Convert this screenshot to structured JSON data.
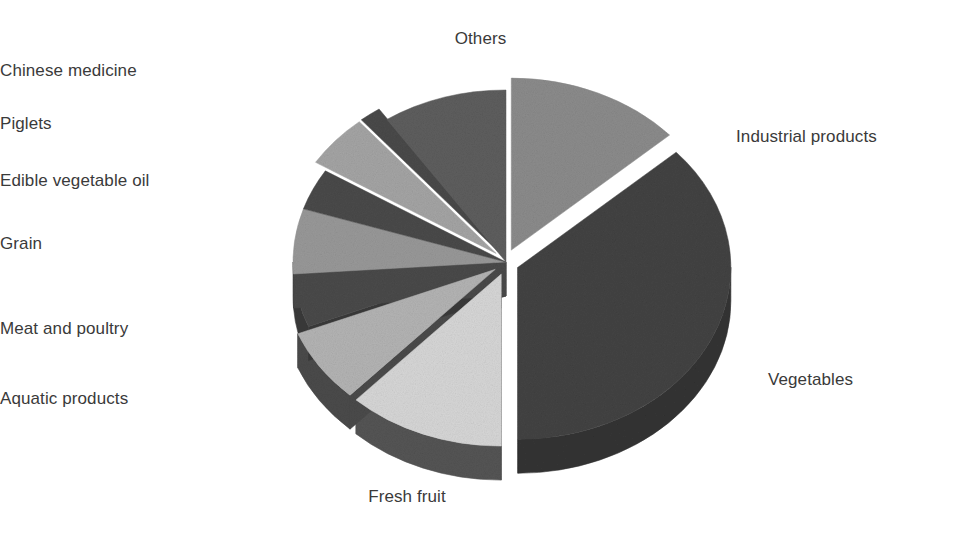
{
  "figure": {
    "background": "#ffffff",
    "text_color": "#3a3a3a"
  },
  "chart_data": {
    "type": "pie",
    "title": "",
    "subtitle": "",
    "xlabel": "",
    "ylabel": "",
    "style": "3d-exploded-pie",
    "grid": false,
    "legend": "none",
    "labels_position": "outside-leaderless",
    "start_angle_deg": 0,
    "direction": "clockwise",
    "categories": [
      "Industrial products",
      "Vegetables",
      "Fresh fruit",
      "Aquatic products",
      "Meat and poultry",
      "Grain",
      "Edible vegetable oil",
      "Piglets",
      "Chinese medicine",
      "Others"
    ],
    "values": [
      13.3,
      36.7,
      11.9,
      6.9,
      5.0,
      6.1,
      3.9,
      5.0,
      1.7,
      9.5
    ],
    "slices": [
      {
        "label": "Industrial products",
        "value": 13.3,
        "start_deg": 0,
        "end_deg": 48,
        "color": "#8c8c8c",
        "side_color": "#6d6d6d",
        "exploded": true
      },
      {
        "label": "Vegetables",
        "value": 36.7,
        "start_deg": 48,
        "end_deg": 180,
        "color": "#434343",
        "side_color": "#343434",
        "exploded": true
      },
      {
        "label": "Fresh fruit",
        "value": 11.9,
        "start_deg": 180,
        "end_deg": 223,
        "color": "#d7d7d7",
        "side_color": "#555555",
        "exploded": true
      },
      {
        "label": "Aquatic products",
        "value": 6.9,
        "start_deg": 223,
        "end_deg": 248,
        "color": "#b4b4b4",
        "side_color": "#4b4b4b",
        "exploded": true
      },
      {
        "label": "Meat and poultry",
        "value": 5.0,
        "start_deg": 248,
        "end_deg": 266,
        "color": "#4a4a4a",
        "side_color": "#3a3a3a",
        "exploded": false
      },
      {
        "label": "Grain",
        "value": 6.1,
        "start_deg": 266,
        "end_deg": 288,
        "color": "#999999",
        "side_color": "#4a4a4a",
        "exploded": false
      },
      {
        "label": "Edible vegetable oil",
        "value": 3.9,
        "start_deg": 288,
        "end_deg": 302,
        "color": "#4a4a4a",
        "side_color": "#3a3a3a",
        "exploded": false
      },
      {
        "label": "Piglets",
        "value": 5.0,
        "start_deg": 302,
        "end_deg": 320,
        "color": "#a5a5a5",
        "side_color": "#4a4a4a",
        "exploded": true
      },
      {
        "label": "Chinese medicine",
        "value": 1.7,
        "start_deg": 320,
        "end_deg": 326,
        "color": "#4a4a4a",
        "side_color": "#3a3a3a",
        "exploded": true
      },
      {
        "label": "Others",
        "value": 9.5,
        "start_deg": 326,
        "end_deg": 360,
        "color": "#5e5e5e",
        "side_color": "#464646",
        "exploded": false
      }
    ]
  },
  "labels": {
    "others": "Others",
    "chinese_medicine": "Chinese medicine",
    "piglets": "Piglets",
    "edible_vegetable_oil": "Edible vegetable oil",
    "grain": "Grain",
    "meat_and_poultry": "Meat and poultry",
    "aquatic_products": "Aquatic products",
    "fresh_fruit": "Fresh fruit",
    "industrial_products": "Industrial products",
    "vegetables": "Vegetables"
  }
}
